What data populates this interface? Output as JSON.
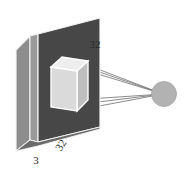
{
  "figure": {
    "type": "neural-network-architecture-diagram",
    "background_color": "#ffffff"
  },
  "labels": {
    "depth": "3",
    "width": "32",
    "height": "32"
  },
  "shapes": {
    "input_volume": {
      "name": "input-volume-slab",
      "front_face_color": "#4a4a4a",
      "side_face_color": "#8f8f8f",
      "top_face_color": "#c9c9c9",
      "outline_color": "#f2f2f2",
      "dims_label_width": "32",
      "dims_label_height": "32",
      "dims_label_depth": "3"
    },
    "receptive_field": {
      "name": "receptive-field-box",
      "front_face_color": "#d9d9d9",
      "side_face_color": "#bdbdbd",
      "top_face_color": "#efefef",
      "outline_color": "#ffffff"
    },
    "output_unit": {
      "name": "output-unit-sphere",
      "fill_color": "#b0b0b0",
      "edge_color": "#9a9a9a"
    },
    "connections": {
      "name": "projection-lines",
      "color": "#6e6e6e",
      "count": 4
    }
  }
}
